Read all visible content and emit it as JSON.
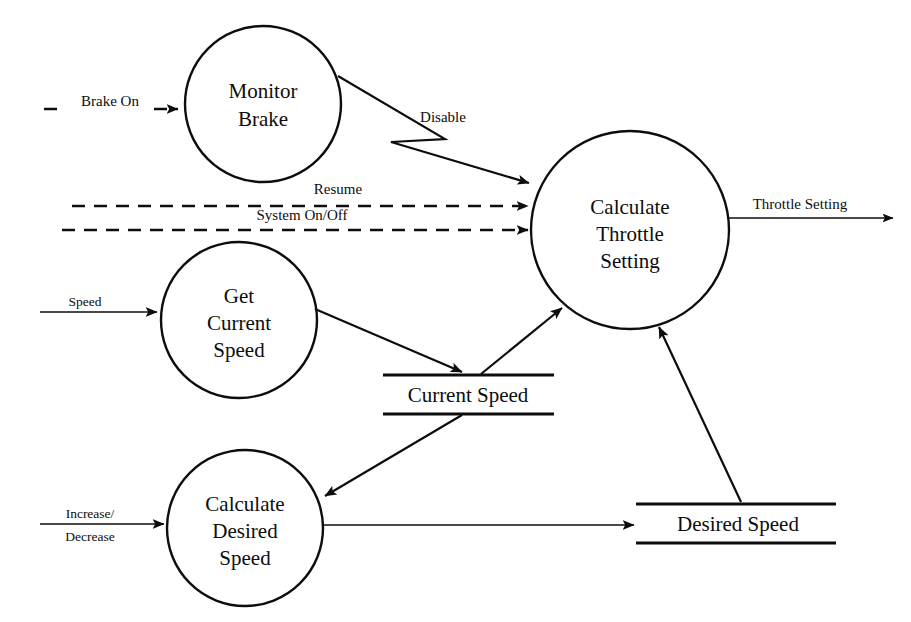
{
  "diagram": {
    "type": "data-flow-diagram",
    "stroke_color": "#0d0d0d",
    "background_color": "#ffffff"
  },
  "processes": [
    {
      "id": "monitor-brake",
      "lines": [
        "Monitor",
        "Brake"
      ],
      "line1": "Monitor",
      "line2": "Brake",
      "cx": 263,
      "cy": 104,
      "r": 78
    },
    {
      "id": "calculate-throttle-setting",
      "lines": [
        "Calculate",
        "Throttle",
        "Setting"
      ],
      "line1": "Calculate",
      "line2": "Throttle",
      "line3": "Setting",
      "cx": 630,
      "cy": 230,
      "r": 99
    },
    {
      "id": "get-current-speed",
      "lines": [
        "Get",
        "Current",
        "Speed"
      ],
      "line1": "Get",
      "line2": "Current",
      "line3": "Speed",
      "cx": 239,
      "cy": 320,
      "r": 78
    },
    {
      "id": "calculate-desired-speed",
      "lines": [
        "Calculate",
        "Desired",
        "Speed"
      ],
      "line1": "Calculate",
      "line2": "Desired",
      "line3": "Speed",
      "cx": 245,
      "cy": 528,
      "r": 78
    }
  ],
  "data_stores": [
    {
      "id": "current-speed-store",
      "label": "Current Speed",
      "x1": 383,
      "x2": 554,
      "y_top": 375,
      "y_bottom": 414
    },
    {
      "id": "desired-speed-store",
      "label": "Desired Speed",
      "x1": 636,
      "x2": 836,
      "y_top": 504,
      "y_bottom": 543
    }
  ],
  "flows": [
    {
      "id": "brake-on",
      "label": "Brake On",
      "style": "dashed",
      "from": "external",
      "to": "monitor-brake"
    },
    {
      "id": "disable",
      "label": "Disable",
      "style": "solid-zigzag",
      "from": "monitor-brake",
      "to": "calculate-throttle-setting"
    },
    {
      "id": "resume",
      "label": "Resume",
      "style": "dashed",
      "from": "external",
      "to": "calculate-throttle-setting"
    },
    {
      "id": "system-on-off",
      "label": "System On/Off",
      "style": "dashed",
      "from": "external",
      "to": "calculate-throttle-setting"
    },
    {
      "id": "throttle-setting",
      "label": "Throttle Setting",
      "style": "solid",
      "from": "calculate-throttle-setting",
      "to": "external"
    },
    {
      "id": "speed",
      "label": "Speed",
      "style": "solid",
      "from": "external",
      "to": "get-current-speed"
    },
    {
      "id": "increase-decrease",
      "label_line1": "Increase/",
      "label_line2": "Decrease",
      "style": "solid",
      "from": "external",
      "to": "calculate-desired-speed"
    },
    {
      "id": "get-speed-to-store",
      "label": "",
      "style": "solid",
      "from": "get-current-speed",
      "to": "current-speed-store"
    },
    {
      "id": "store-to-throttle",
      "label": "",
      "style": "solid",
      "from": "current-speed-store",
      "to": "calculate-throttle-setting"
    },
    {
      "id": "store-to-desired",
      "label": "",
      "style": "solid",
      "from": "current-speed-store",
      "to": "calculate-desired-speed"
    },
    {
      "id": "desired-to-store",
      "label": "",
      "style": "solid",
      "from": "calculate-desired-speed",
      "to": "desired-speed-store"
    },
    {
      "id": "desired-store-to-throttle",
      "label": "",
      "style": "solid",
      "from": "desired-speed-store",
      "to": "calculate-throttle-setting"
    }
  ]
}
